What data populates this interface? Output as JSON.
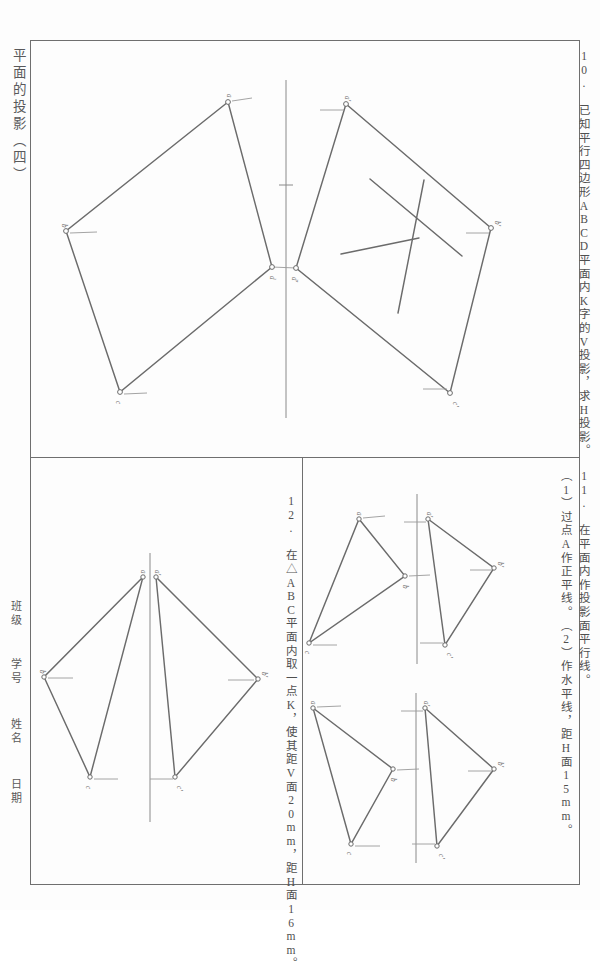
{
  "sheet": {
    "title": "平面的投影（四）",
    "side_labels": [
      {
        "name": "class",
        "text": "班级"
      },
      {
        "name": "student-number",
        "text": "学号"
      },
      {
        "name": "student-name",
        "text": "姓名"
      },
      {
        "name": "date",
        "text": "日期"
      }
    ],
    "frame_color": "#6f6f6f",
    "line_color": "#6b6b6b",
    "paper_color": "#fdfdfd"
  },
  "problems": [
    {
      "id": "10",
      "number": "10.",
      "text": "10. 已知平行四边形ABCD平面内K字的V投影，求H投影。",
      "shape_label": "ABCD",
      "given_projection": "V",
      "required_projection": "H",
      "letter_shape": "K"
    },
    {
      "id": "11",
      "number": "11.",
      "text": "11. 在平面内作投影面平行线。",
      "sub_items": [
        "（1）过点A作正平线。",
        "（2）作水平线，距H面15mm。"
      ],
      "dimension_1": "15mm"
    },
    {
      "id": "12",
      "number": "12.",
      "text": "12. 在△ABC平面内取一点K，使其距V面20mm，距H面16mm。",
      "shape_label": "ABC",
      "point_label": "K",
      "dist_v": "20mm",
      "dist_h": "16mm"
    }
  ],
  "figures": {
    "fig10": {
      "name": "parallelogram-projection",
      "h_vertices": [
        {
          "label": "a",
          "x": 228,
          "y": 102
        },
        {
          "label": "b",
          "x": 66,
          "y": 231
        },
        {
          "label": "c",
          "x": 120,
          "y": 392
        },
        {
          "label": "d",
          "x": 272,
          "y": 267
        }
      ],
      "v_vertices": [
        {
          "label": "a'",
          "x": 346,
          "y": 104
        },
        {
          "label": "b'",
          "x": 491,
          "y": 228
        },
        {
          "label": "c'",
          "x": 450,
          "y": 393
        },
        {
          "label": "d'",
          "x": 296,
          "y": 268
        }
      ]
    },
    "fig11a": {
      "name": "triangle-projection-upper",
      "h_vertices": [
        {
          "label": "a",
          "x": 359,
          "y": 519
        },
        {
          "label": "b",
          "x": 405,
          "y": 576
        },
        {
          "label": "c",
          "x": 309,
          "y": 643
        }
      ],
      "v_vertices": [
        {
          "label": "a'",
          "x": 428,
          "y": 519
        },
        {
          "label": "b'",
          "x": 494,
          "y": 568
        },
        {
          "label": "c'",
          "x": 445,
          "y": 645
        }
      ]
    },
    "fig11b": {
      "name": "triangle-projection-lower",
      "h_vertices": [
        {
          "label": "a",
          "x": 313,
          "y": 708
        },
        {
          "label": "b",
          "x": 393,
          "y": 769
        },
        {
          "label": "c",
          "x": 351,
          "y": 844
        }
      ],
      "v_vertices": [
        {
          "label": "a'",
          "x": 425,
          "y": 708
        },
        {
          "label": "b'",
          "x": 494,
          "y": 769
        },
        {
          "label": "c'",
          "x": 437,
          "y": 846
        }
      ]
    },
    "fig12": {
      "name": "triangle-abc-point-k",
      "h_vertices": [
        {
          "label": "a",
          "x": 143,
          "y": 577
        },
        {
          "label": "b",
          "x": 44,
          "y": 677
        },
        {
          "label": "c",
          "x": 90,
          "y": 777
        }
      ],
      "v_vertices": [
        {
          "label": "a'",
          "x": 156,
          "y": 577
        },
        {
          "label": "b'",
          "x": 258,
          "y": 679
        },
        {
          "label": "c'",
          "x": 175,
          "y": 777
        }
      ]
    }
  }
}
